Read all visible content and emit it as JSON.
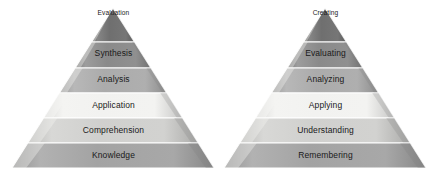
{
  "figure": {
    "background_color": "#ffffff",
    "title": "",
    "pyramids": [
      {
        "id": "original-blooms-taxonomy",
        "name": "Original Bloom's Taxonomy pyramid",
        "apex_x": 113,
        "apex_y": 8,
        "base_left_x": 10,
        "base_right_x": 212,
        "base_y": 168,
        "bands": [
          {
            "label": "Evaluation",
            "fill": "#6f6f6f",
            "top_y": 8,
            "bottom_y": 42,
            "label_y": 9,
            "apex": true
          },
          {
            "label": "Synthesis",
            "fill": "#8a8a8a",
            "top_y": 42,
            "bottom_y": 68,
            "label_y": 48,
            "apex": false
          },
          {
            "label": "Analysis",
            "fill": "#ababab",
            "top_y": 68,
            "bottom_y": 93,
            "label_y": 74,
            "apex": false
          },
          {
            "label": "Application",
            "fill": "#f2f2f0",
            "top_y": 93,
            "bottom_y": 118,
            "label_y": 100,
            "apex": false
          },
          {
            "label": "Comprehension",
            "fill": "#d0d0ce",
            "top_y": 118,
            "bottom_y": 143,
            "label_y": 125,
            "apex": false
          },
          {
            "label": "Knowledge",
            "fill": "#a3a3a3",
            "top_y": 143,
            "bottom_y": 168,
            "label_y": 150,
            "apex": false
          }
        ]
      },
      {
        "id": "revised-blooms-taxonomy",
        "name": "Revised Bloom's Taxonomy pyramid",
        "apex_x": 108,
        "apex_y": 8,
        "base_left_x": 5,
        "base_right_x": 207,
        "base_y": 168,
        "bands": [
          {
            "label": "Creating",
            "fill": "#6f6f6f",
            "top_y": 8,
            "bottom_y": 42,
            "label_y": 9,
            "apex": true
          },
          {
            "label": "Evaluating",
            "fill": "#8a8a8a",
            "top_y": 42,
            "bottom_y": 68,
            "label_y": 48,
            "apex": false
          },
          {
            "label": "Analyzing",
            "fill": "#ababab",
            "top_y": 68,
            "bottom_y": 93,
            "label_y": 74,
            "apex": false
          },
          {
            "label": "Applying",
            "fill": "#f2f2f0",
            "top_y": 93,
            "bottom_y": 118,
            "label_y": 100,
            "apex": false
          },
          {
            "label": "Understanding",
            "fill": "#d0d0ce",
            "top_y": 118,
            "bottom_y": 143,
            "label_y": 125,
            "apex": false
          },
          {
            "label": "Remembering",
            "fill": "#a3a3a3",
            "top_y": 143,
            "bottom_y": 168,
            "label_y": 150,
            "apex": false
          }
        ]
      }
    ],
    "colors": {
      "separator": "#ffffff",
      "edge_highlight": "#f4f4f2",
      "edge_shadow": "#7d7d7d",
      "label_text": "#1a1a1a"
    }
  }
}
